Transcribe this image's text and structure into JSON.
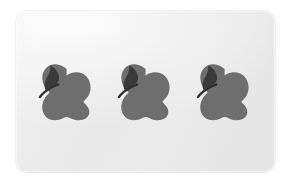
{
  "scene": {
    "title": "Three apples on a card",
    "background_color": "#ffffff"
  },
  "card": {
    "name": "apple-card",
    "background_color": "#ececec",
    "border_color": "#dcdcdc",
    "corner_radius_px": 11,
    "width_px": 259,
    "height_px": 161,
    "left_px": 16,
    "top_px": 11
  },
  "apples": {
    "count": 3,
    "body_color": "#6e6e6e",
    "leaf_color": "#3a3a3a",
    "stem_color": "#303030",
    "items": [
      {
        "label": "apple-1",
        "index": 1
      },
      {
        "label": "apple-2",
        "index": 2
      },
      {
        "label": "apple-3",
        "index": 3
      }
    ]
  }
}
